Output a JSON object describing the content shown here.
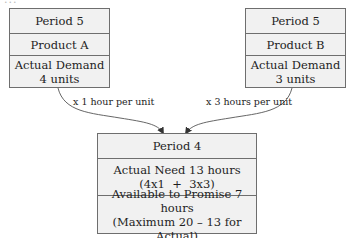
{
  "diagram": {
    "clipped_header_text": "...",
    "source_nodes": [
      {
        "period": "Period 5",
        "product": "Product A",
        "demand_label": "Actual Demand",
        "demand_value": "4 units"
      },
      {
        "period": "Period 5",
        "product": "Product B",
        "demand_label": "Actual Demand",
        "demand_value": "3 units"
      }
    ],
    "edges": [
      {
        "from": "Product A",
        "to": "Period 4",
        "label": "x 1 hour per unit"
      },
      {
        "from": "Product B",
        "to": "Period 4",
        "label": "x 3 hours per unit"
      }
    ],
    "target_node": {
      "period": "Period 4",
      "need_label": "Actual Need 13 hours",
      "need_formula": "(4x1  +  3x3)",
      "atp_label": "Available to Promise 7 hours",
      "atp_formula": "(Maximum 20 – 13 for Actual)"
    },
    "colors": {
      "box_fill": "#f1f1f1",
      "box_border": "#6e6e6e",
      "line": "#555555",
      "text": "#1e1e1e"
    }
  }
}
